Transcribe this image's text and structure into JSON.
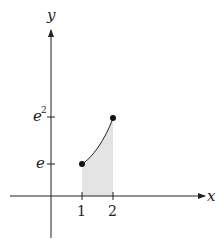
{
  "diagram": {
    "axes": {
      "x_label": "x",
      "y_label": "y"
    },
    "x_ticks": [
      "1",
      "2"
    ],
    "y_ticks": [
      "e",
      "e",
      "2"
    ],
    "y_tick_labels": {
      "e": "e",
      "e2_base": "e",
      "e2_exp": "2"
    },
    "curve": "y = e^x from x=1 to x=2",
    "points": [
      {
        "x": 1,
        "y": "e"
      },
      {
        "x": 2,
        "y": "e^2"
      }
    ],
    "shaded_region": "area under curve between x=1 and x=2",
    "colors": {
      "axis": "#222222",
      "shade": "#e6e6e6",
      "curve": "#222222"
    }
  }
}
